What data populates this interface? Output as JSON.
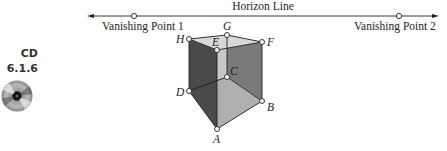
{
  "sidebar": {
    "cd_title": "CD",
    "cd_section": "6.1.6",
    "icon": "cd-disc-icon"
  },
  "diagram": {
    "horizon_label": "Horizon Line",
    "vanishing_point_1": "Vanishing Point 1",
    "vanishing_point_2": "Vanishing Point 2",
    "points": {
      "A": "A",
      "B": "B",
      "C": "C",
      "D": "D",
      "E": "E",
      "F": "F",
      "G": "G",
      "H": "H"
    },
    "colors": {
      "dark_face": "#4a4a4a",
      "mid_face": "#7a7a7a",
      "light_face": "#c4c4c4",
      "top_face": "#d8d8d8",
      "floor_face": "#a8a8a8",
      "line": "#222222"
    }
  }
}
